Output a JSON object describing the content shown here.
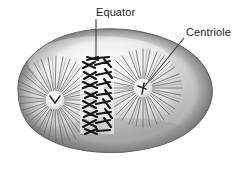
{
  "figure": {
    "type": "biology-diagram",
    "background_color": "#ffffff",
    "cell": {
      "name": "cell-body",
      "outline_color": "#5a5a5a",
      "fill_light": "#f2f2f2",
      "fill_mid": "#b8b8b8",
      "fill_dark": "#8a8a8a",
      "bounds": {
        "left": 12,
        "top": 28,
        "right": 213,
        "bottom": 151
      }
    },
    "structures": {
      "chromosomes": {
        "name": "chromosomes-at-equator",
        "color": "#1a1a1a",
        "count": 9,
        "band": {
          "x": 82,
          "y": 58,
          "width": 30,
          "height": 74
        }
      },
      "aster_left": {
        "name": "aster-left",
        "center_x": 55,
        "center_y": 100,
        "radius": 42,
        "fiber_color": "#6e6e6e"
      },
      "aster_right": {
        "name": "aster-right",
        "center_x": 143,
        "center_y": 88,
        "radius": 40,
        "fiber_color": "#6e6e6e"
      },
      "centriole_left": {
        "name": "centriole-left",
        "center_x": 55,
        "center_y": 100,
        "radius": 9,
        "color": "#2b2b2b"
      },
      "centriole_right": {
        "name": "centriole-right",
        "center_x": 143,
        "center_y": 88,
        "radius": 9,
        "color": "#2b2b2b"
      }
    },
    "labels": [
      {
        "id": "equator",
        "text": "Equator",
        "text_x": 96,
        "text_y": 6,
        "leader": {
          "x1": 96,
          "y1": 19,
          "x2": 96,
          "y2": 58
        },
        "leader_color": "#3a3a3a"
      },
      {
        "id": "centriole",
        "text": "Centriole",
        "text_x": 186,
        "text_y": 26,
        "leader": {
          "x1": 184,
          "y1": 38,
          "x2": 144,
          "y2": 87
        },
        "leader_color": "#3a3a3a"
      }
    ]
  }
}
